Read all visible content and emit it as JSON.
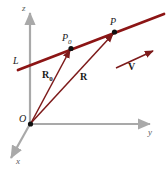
{
  "figure": {
    "colors": {
      "line": "#8c1515",
      "vector": "#7d1a1a",
      "axis": "#a9a9a9",
      "point": "#111111",
      "background": "#ffffff"
    },
    "axes": [
      {
        "id": "z",
        "label": "z",
        "direction": "up"
      },
      {
        "id": "y",
        "label": "y",
        "direction": "right"
      },
      {
        "id": "x",
        "label": "x",
        "direction": "down-left"
      }
    ],
    "points": [
      {
        "id": "origin",
        "label": "O"
      },
      {
        "id": "p0",
        "label": "P",
        "subscript": "0"
      },
      {
        "id": "p",
        "label": "P",
        "subscript": ""
      }
    ],
    "line": {
      "id": "L",
      "label": "L"
    },
    "vectors": [
      {
        "id": "R0",
        "label": "R",
        "subscript": "0",
        "from": "O",
        "to": "P0"
      },
      {
        "id": "R",
        "label": "R",
        "subscript": "",
        "from": "O",
        "to": "P"
      },
      {
        "id": "V",
        "label": "V",
        "subscript": "",
        "from": "",
        "to": ""
      }
    ]
  }
}
